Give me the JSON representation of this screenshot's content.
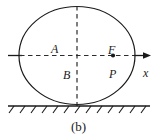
{
  "figure": {
    "caption": "(b)",
    "labels": {
      "center_label": "A",
      "lower_point_label": "B",
      "force_label": "F",
      "point_label": "P",
      "axis_label": "x"
    },
    "colors": {
      "stroke": "#1a1a1a",
      "background": "#ffffff",
      "dashed": "#2b2b2b"
    },
    "geometry": {
      "body_shape": "ellipse",
      "body_center_x": 77,
      "body_center_y": 55,
      "body_radius_x": 58,
      "body_radius_y": 49,
      "ground_line_y": 106,
      "ground_line_x_start": 8,
      "ground_line_x_end": 150,
      "hatch_tick_count": 13,
      "axis_arrow_tip_x": 151,
      "axis_arrow_y": 55,
      "point_marker_x": 113,
      "point_marker_y": 55,
      "vertical_dashed_x": 77
    }
  }
}
